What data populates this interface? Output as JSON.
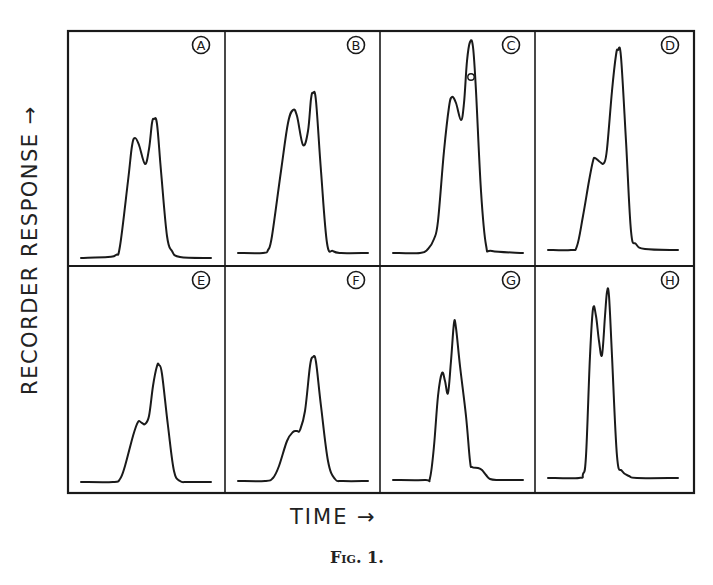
{
  "figure": {
    "caption": "Fig. 1.",
    "ylabel": "RECORDER   RESPONSE →",
    "xlabel": "TIME →"
  },
  "chart_data": {
    "type": "line",
    "title": "",
    "caption": "Fig. 1.",
    "xlabel": "TIME",
    "ylabel": "RECORDER RESPONSE",
    "grid": false,
    "legend": null,
    "layout": "2x4 panel grid, each panel labelled with a circled letter in the upper-right corner; axes unscaled",
    "panels": [
      {
        "label": "A",
        "row": 0,
        "col": 0,
        "description": "doublet, second peak slightly higher",
        "points": [
          [
            13,
            227
          ],
          [
            40,
            226
          ],
          [
            48,
            224
          ],
          [
            52,
            215
          ],
          [
            60,
            150
          ],
          [
            64,
            115
          ],
          [
            67,
            107
          ],
          [
            71,
            114
          ],
          [
            77,
            133
          ],
          [
            81,
            118
          ],
          [
            84,
            92
          ],
          [
            86,
            88
          ],
          [
            89,
            93
          ],
          [
            93,
            140
          ],
          [
            99,
            205
          ],
          [
            104,
            220
          ],
          [
            112,
            226
          ],
          [
            143,
            227
          ]
        ]
      },
      {
        "label": "B",
        "row": 0,
        "col": 1,
        "description": "doublet, both peaks taller, second higher",
        "points": [
          [
            13,
            222
          ],
          [
            38,
            222
          ],
          [
            43,
            219
          ],
          [
            47,
            205
          ],
          [
            56,
            140
          ],
          [
            63,
            92
          ],
          [
            68,
            79
          ],
          [
            72,
            85
          ],
          [
            78,
            114
          ],
          [
            83,
            100
          ],
          [
            86,
            68
          ],
          [
            88,
            62
          ],
          [
            91,
            70
          ],
          [
            96,
            140
          ],
          [
            102,
            212
          ],
          [
            108,
            220
          ],
          [
            116,
            222
          ],
          [
            143,
            222
          ]
        ]
      },
      {
        "label": "C",
        "row": 0,
        "col": 2,
        "description": "doublet with dominant tall second peak; small circled annotation mark on second peak",
        "annotation": {
          "x": 91,
          "y": 46
        },
        "points": [
          [
            13,
            222
          ],
          [
            40,
            222
          ],
          [
            48,
            218
          ],
          [
            54,
            208
          ],
          [
            58,
            190
          ],
          [
            64,
            120
          ],
          [
            69,
            76
          ],
          [
            72,
            66
          ],
          [
            76,
            72
          ],
          [
            81,
            89
          ],
          [
            84,
            72
          ],
          [
            87,
            30
          ],
          [
            90,
            11
          ],
          [
            93,
            16
          ],
          [
            96,
            60
          ],
          [
            101,
            160
          ],
          [
            106,
            214
          ],
          [
            112,
            220
          ],
          [
            143,
            222
          ]
        ]
      },
      {
        "label": "D",
        "row": 0,
        "col": 3,
        "description": "single tall peak with low shoulder on leading edge",
        "points": [
          [
            13,
            219
          ],
          [
            36,
            219
          ],
          [
            42,
            215
          ],
          [
            48,
            185
          ],
          [
            54,
            150
          ],
          [
            58,
            130
          ],
          [
            60,
            127
          ],
          [
            65,
            131
          ],
          [
            69,
            132
          ],
          [
            72,
            118
          ],
          [
            77,
            60
          ],
          [
            81,
            24
          ],
          [
            83,
            19
          ],
          [
            86,
            26
          ],
          [
            91,
            110
          ],
          [
            96,
            200
          ],
          [
            101,
            213
          ],
          [
            110,
            218
          ],
          [
            143,
            219
          ]
        ]
      },
      {
        "label": "E",
        "row": 1,
        "col": 0,
        "description": "main peak with small shoulder on leading edge",
        "points": [
          [
            13,
            216
          ],
          [
            45,
            216
          ],
          [
            52,
            213
          ],
          [
            57,
            200
          ],
          [
            65,
            170
          ],
          [
            70,
            156
          ],
          [
            74,
            157
          ],
          [
            77,
            158
          ],
          [
            81,
            150
          ],
          [
            85,
            120
          ],
          [
            89,
            100
          ],
          [
            91,
            99
          ],
          [
            94,
            108
          ],
          [
            100,
            160
          ],
          [
            106,
            205
          ],
          [
            112,
            215
          ],
          [
            120,
            216
          ],
          [
            143,
            216
          ]
        ]
      },
      {
        "label": "F",
        "row": 1,
        "col": 1,
        "description": "main peak with faint shoulder on leading edge",
        "points": [
          [
            13,
            215
          ],
          [
            40,
            215
          ],
          [
            48,
            212
          ],
          [
            54,
            200
          ],
          [
            62,
            175
          ],
          [
            68,
            166
          ],
          [
            72,
            165
          ],
          [
            75,
            164
          ],
          [
            80,
            145
          ],
          [
            85,
            100
          ],
          [
            88,
            91
          ],
          [
            91,
            96
          ],
          [
            96,
            140
          ],
          [
            103,
            195
          ],
          [
            110,
            213
          ],
          [
            118,
            215
          ],
          [
            143,
            215
          ]
        ]
      },
      {
        "label": "G",
        "row": 1,
        "col": 2,
        "description": "doublet with taller second peak followed by a trailing tail shoulder",
        "points": [
          [
            13,
            214
          ],
          [
            45,
            214
          ],
          [
            50,
            212
          ],
          [
            54,
            180
          ],
          [
            58,
            130
          ],
          [
            62,
            107
          ],
          [
            65,
            115
          ],
          [
            68,
            127
          ],
          [
            71,
            95
          ],
          [
            74,
            57
          ],
          [
            76,
            62
          ],
          [
            80,
            100
          ],
          [
            86,
            150
          ],
          [
            90,
            195
          ],
          [
            92,
            201
          ],
          [
            98,
            202
          ],
          [
            102,
            204
          ],
          [
            106,
            209
          ],
          [
            110,
            213
          ],
          [
            118,
            214
          ],
          [
            143,
            214
          ]
        ]
      },
      {
        "label": "H",
        "row": 1,
        "col": 3,
        "description": "sharp, well-resolved doublet, second peak slightly higher",
        "points": [
          [
            13,
            212
          ],
          [
            44,
            212
          ],
          [
            48,
            208
          ],
          [
            51,
            190
          ],
          [
            55,
            90
          ],
          [
            58,
            43
          ],
          [
            61,
            50
          ],
          [
            64,
            75
          ],
          [
            67,
            89
          ],
          [
            70,
            50
          ],
          [
            72,
            26
          ],
          [
            74,
            30
          ],
          [
            77,
            90
          ],
          [
            82,
            190
          ],
          [
            87,
            205
          ],
          [
            94,
            210
          ],
          [
            102,
            212
          ],
          [
            143,
            212
          ]
        ]
      }
    ],
    "panel_labels": [
      "A",
      "B",
      "C",
      "D",
      "E",
      "F",
      "G",
      "H"
    ]
  },
  "style": {
    "ink": "#1a1a1a",
    "paper": "#ffffff"
  }
}
